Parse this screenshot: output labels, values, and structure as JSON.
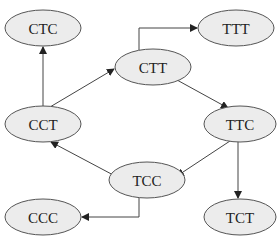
{
  "diagram": {
    "type": "directed-graph",
    "colors": {
      "node_fill": "#ececec",
      "node_stroke": "#555555",
      "edge": "#444444",
      "background": "#ffffff"
    },
    "nodes": [
      {
        "id": "CTC",
        "label": "CTC",
        "cx": 43,
        "cy": 28
      },
      {
        "id": "TTT",
        "label": "TTT",
        "cx": 236,
        "cy": 28
      },
      {
        "id": "CTT",
        "label": "CTT",
        "cx": 153,
        "cy": 67
      },
      {
        "id": "CCT",
        "label": "CCT",
        "cx": 43,
        "cy": 124
      },
      {
        "id": "TTC",
        "label": "TTC",
        "cx": 240,
        "cy": 124
      },
      {
        "id": "TCC",
        "label": "TCC",
        "cx": 147,
        "cy": 180
      },
      {
        "id": "CCC",
        "label": "CCC",
        "cx": 43,
        "cy": 220
      },
      {
        "id": "TCT",
        "label": "TCT",
        "cx": 240,
        "cy": 217
      }
    ],
    "edges": [
      {
        "from": "CCT",
        "to": "CTC"
      },
      {
        "from": "CCT",
        "to": "CTT"
      },
      {
        "from": "CTT",
        "to": "TTT"
      },
      {
        "from": "CTT",
        "to": "TTC"
      },
      {
        "from": "TTC",
        "to": "TCC"
      },
      {
        "from": "TTC",
        "to": "TCT"
      },
      {
        "from": "TCC",
        "to": "CCT"
      },
      {
        "from": "TCC",
        "to": "CCC"
      }
    ]
  }
}
